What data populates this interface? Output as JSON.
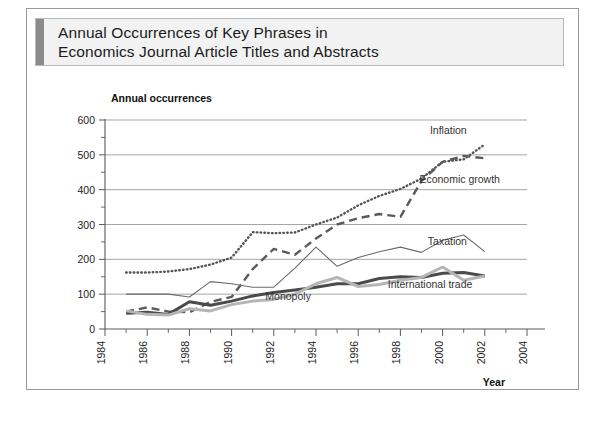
{
  "figure": {
    "title_line1": "Annual Occurrences of Key Phrases in",
    "title_line2": "Economics Journal Article Titles and Abstracts"
  },
  "colors": {
    "inflation": "#555555",
    "economic_growth": "#5a5a5a",
    "taxation": "#6b6b6b",
    "international_trade": "#4a4a4a",
    "monopoly": "#b5b5b5",
    "grid": "#9b9b9b",
    "axis": "#5a5a5a",
    "banner_accent": "#8b8b8b",
    "banner_fill": "#f2f2f2"
  },
  "chart_data": {
    "type": "line",
    "title": "Annual Occurrences of Key Phrases in Economics Journal Article Titles and Abstracts",
    "xlabel": "Year",
    "ylabel": "Annual occurrences",
    "xlim": [
      1984,
      2004
    ],
    "ylim": [
      0,
      600
    ],
    "x_tick_labels": [
      "1984",
      "1986",
      "1988",
      "1990",
      "1992",
      "1994",
      "1996",
      "1998",
      "2000",
      "2002",
      "2004"
    ],
    "x_tick_values": [
      1984,
      1986,
      1988,
      1990,
      1992,
      1994,
      1996,
      1998,
      2000,
      2002,
      2004
    ],
    "x_minor_step": 1,
    "y_tick_labels": [
      "0",
      "100",
      "200",
      "300",
      "400",
      "500",
      "600"
    ],
    "y_tick_values": [
      0,
      100,
      200,
      300,
      400,
      500,
      600
    ],
    "y_minor_step": 50,
    "grid": "horizontal",
    "legend_position": "inline-annotations",
    "x": [
      1985,
      1986,
      1987,
      1988,
      1989,
      1990,
      1991,
      1992,
      1993,
      1994,
      1995,
      1996,
      1997,
      1998,
      1999,
      2000,
      2001,
      2002
    ],
    "series": [
      {
        "name": "Inflation",
        "style": "dotted",
        "label_x": 1999.4,
        "label_y": 560,
        "values": [
          162,
          162,
          165,
          172,
          185,
          205,
          278,
          275,
          277,
          300,
          320,
          355,
          382,
          402,
          432,
          480,
          487,
          530
        ]
      },
      {
        "name": "Economic growth",
        "style": "dashed",
        "label_x": 1998.9,
        "label_y": 420,
        "values": [
          50,
          62,
          50,
          48,
          78,
          92,
          172,
          230,
          213,
          260,
          300,
          318,
          330,
          322,
          425,
          480,
          497,
          490
        ]
      },
      {
        "name": "Taxation",
        "style": "solid-thin",
        "label_x": 1999.3,
        "label_y": 242,
        "values": [
          100,
          100,
          100,
          92,
          136,
          130,
          120,
          120,
          175,
          235,
          180,
          205,
          222,
          235,
          220,
          255,
          270,
          222
        ]
      },
      {
        "name": "International trade",
        "style": "solid-thick-dark",
        "label_x": 1997.4,
        "label_y": 118,
        "values": [
          45,
          48,
          42,
          78,
          68,
          80,
          95,
          105,
          112,
          120,
          130,
          130,
          145,
          150,
          148,
          160,
          162,
          152
        ]
      },
      {
        "name": "Monopoly",
        "style": "solid-thick-light",
        "label_x": 1991.6,
        "label_y": 82,
        "values": [
          52,
          42,
          40,
          58,
          52,
          70,
          80,
          85,
          100,
          130,
          148,
          122,
          128,
          140,
          148,
          178,
          140,
          152
        ]
      }
    ]
  }
}
